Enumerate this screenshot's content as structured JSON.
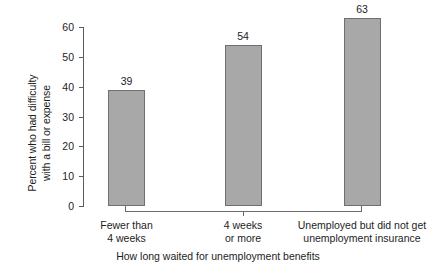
{
  "chart_data": {
    "type": "bar",
    "title": "",
    "categories": [
      "Fewer than\n4 weeks",
      "4 weeks\nor more",
      "Unemployed but did not get\nunemployment insurance"
    ],
    "category_lines": [
      [
        "Fewer than",
        "4 weeks"
      ],
      [
        "4 weeks",
        "or more"
      ],
      [
        "Unemployed but did not get",
        "unemployment insurance"
      ]
    ],
    "values": [
      39,
      54,
      63
    ],
    "value_labels": [
      "39",
      "54",
      "63"
    ],
    "xlabel": "How long waited for unemployment benefits",
    "ylabel": "Percent who had difficulty with a bill or expense",
    "ylabel_lines": [
      "Percent who had difficulty",
      "with a bill or expense"
    ],
    "ylim": [
      0,
      60
    ],
    "yticks": [
      0,
      10,
      20,
      30,
      40,
      50,
      60
    ],
    "ytick_labels": [
      "0",
      "10",
      "20",
      "30",
      "40",
      "50",
      "60"
    ],
    "grid": false,
    "legend": "none",
    "bar_fill_color": "#a8a8a8",
    "bar_border_color": "#6f6f6f",
    "axis_color": "#5a5a5a",
    "text_color": "#1d1d1d",
    "background_color": "#ffffff"
  }
}
